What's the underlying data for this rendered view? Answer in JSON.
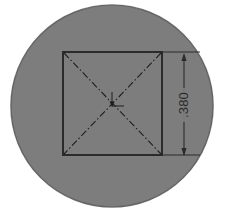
{
  "drawing": {
    "title": "technical-drawing-disc-with-square",
    "background_color": "#ffffff",
    "part": {
      "name": "circular-disc",
      "shape": "circle",
      "fill_color": "#7d7d7d",
      "edge_color": "#5e5e5e",
      "center_x": 112,
      "center_y": 106,
      "radius": 101
    },
    "square": {
      "name": "inscribed-square",
      "edge_color": "#2b2b2b",
      "left": 63,
      "top": 52,
      "right": 162,
      "bottom": 155,
      "width": 99,
      "height": 103
    },
    "centerlines": {
      "name": "diagonal-centerlines",
      "style": "dash-dot",
      "color": "#1e1e1e",
      "count": 2
    },
    "center_mark": {
      "name": "center-mark",
      "x": 112,
      "y": 104
    },
    "dimension": {
      "name": "vertical-dimension",
      "value": ".380",
      "orientation": "vertical",
      "text_rotation_deg": -90,
      "line_x": 184,
      "arrow_top_y": 55,
      "arrow_bottom_y": 155,
      "extension_top_y": 52,
      "extension_bottom_y": 155,
      "extension_left_x": 162,
      "extension_right_x": 200,
      "color": "#2b2b2b",
      "text_x": 184,
      "text_y": 105
    }
  }
}
